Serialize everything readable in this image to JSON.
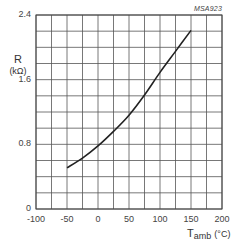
{
  "figure": {
    "reference_code": "MSA923",
    "y_axis": {
      "symbol": "R",
      "unit": "(kΩ)"
    },
    "x_axis": {
      "symbol": "T",
      "subscript": "amb",
      "unit": "(°C)"
    }
  },
  "y_ticks": [
    {
      "label": "2.4",
      "value": 2.4
    },
    {
      "label": "1.6",
      "value": 1.6
    },
    {
      "label": "0.8",
      "value": 0.8
    },
    {
      "label": "0",
      "value": 0
    }
  ],
  "x_ticks": [
    {
      "label": "-100",
      "value": -100
    },
    {
      "label": "-50",
      "value": -50
    },
    {
      "label": "0",
      "value": 0
    },
    {
      "label": "50",
      "value": 50
    },
    {
      "label": "100",
      "value": 100
    },
    {
      "label": "150",
      "value": 150
    },
    {
      "label": "200",
      "value": 200
    }
  ],
  "chart_data": {
    "type": "line",
    "title": "",
    "xlabel": "Tamb (°C)",
    "ylabel": "R (kΩ)",
    "xlim": [
      -100,
      200
    ],
    "ylim": [
      0,
      2.4
    ],
    "x_major_ticks": [
      -100,
      -50,
      0,
      50,
      100,
      150,
      200
    ],
    "y_major_ticks": [
      0,
      0.8,
      1.6,
      2.4
    ],
    "grid": {
      "on": true,
      "x_step": 25,
      "y_step": 0.2
    },
    "legend": null,
    "annotations": [
      "MSA923"
    ],
    "series": [
      {
        "name": "R vs Tamb",
        "x": [
          -50,
          -25,
          0,
          25,
          50,
          75,
          100,
          125,
          150
        ],
        "y": [
          0.51,
          0.63,
          0.78,
          0.96,
          1.16,
          1.41,
          1.69,
          1.95,
          2.21
        ]
      }
    ]
  }
}
